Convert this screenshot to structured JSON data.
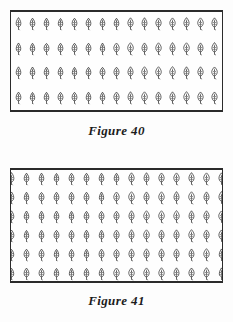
{
  "document": {
    "background_color": "#fdfdfd",
    "ink_color": "#2b2b2b"
  },
  "figures": [
    {
      "id": "figure-40",
      "caption": "Figure 40",
      "symbol": "tree-icon",
      "frame": {
        "border_color": "#2b2b2b",
        "fill_color": "#fefefe"
      },
      "grid": {
        "columns": 15,
        "rows": 4,
        "total_symbols": 60,
        "clipped_at_edges": false
      }
    },
    {
      "id": "figure-41",
      "caption": "Figure 41",
      "symbol": "tree-icon",
      "frame": {
        "border_color": "#2b2b2b",
        "fill_color": "#fefefe"
      },
      "grid": {
        "columns": 15,
        "rows": 6,
        "total_symbols": 90,
        "clipped_at_edges": true
      }
    }
  ]
}
